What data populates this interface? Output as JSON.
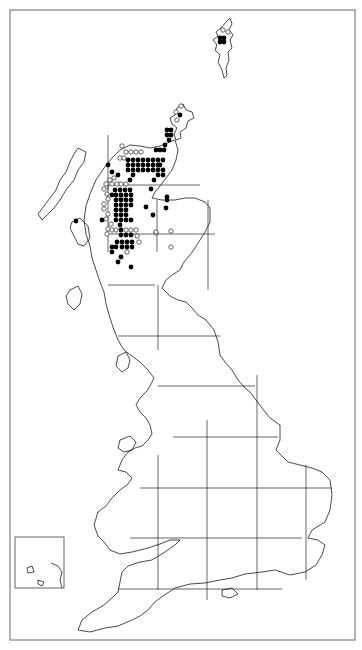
{
  "map": {
    "title": "",
    "region": "Great Britain distribution map",
    "colors": {
      "frame": "#8a8a8a",
      "coast": "#1a1a1a",
      "grid": "#222222",
      "present": "#000000",
      "absent_or_old": "#ffffff"
    },
    "frame": {
      "x": 10,
      "y": 10,
      "w": 345,
      "h": 630
    },
    "inset": {
      "x": 15,
      "y": 537,
      "w": 49,
      "h": 51
    },
    "grid": {
      "vertical": [
        {
          "x": 108,
          "y1": 185,
          "y2": 252
        },
        {
          "x": 108,
          "y1": 135,
          "y2": 190
        },
        {
          "x": 158,
          "y1": 455,
          "y2": 590
        },
        {
          "x": 158,
          "y1": 285,
          "y2": 350
        },
        {
          "x": 157,
          "y1": 200,
          "y2": 252
        },
        {
          "x": 207,
          "y1": 420,
          "y2": 600
        },
        {
          "x": 208,
          "y1": 200,
          "y2": 290
        },
        {
          "x": 257,
          "y1": 375,
          "y2": 590
        },
        {
          "x": 306,
          "y1": 465,
          "y2": 580
        }
      ],
      "horizontal": [
        {
          "y": 185,
          "x1": 108,
          "x2": 200
        },
        {
          "y": 234,
          "x1": 108,
          "x2": 215
        },
        {
          "y": 285,
          "x1": 108,
          "x2": 155
        },
        {
          "y": 336,
          "x1": 118,
          "x2": 220
        },
        {
          "y": 386,
          "x1": 158,
          "x2": 255
        },
        {
          "y": 437,
          "x1": 173,
          "x2": 278
        },
        {
          "y": 488,
          "x1": 140,
          "x2": 332
        },
        {
          "y": 538,
          "x1": 130,
          "x2": 302
        },
        {
          "y": 589,
          "x1": 118,
          "x2": 282
        }
      ]
    },
    "legend": {
      "filled": "recorded (recent)",
      "open": "recorded (earlier)"
    },
    "dots": {
      "filled": [
        [
          220,
          38
        ],
        [
          224,
          38
        ],
        [
          220,
          42
        ],
        [
          224,
          42
        ],
        [
          180,
          115
        ],
        [
          167,
          130
        ],
        [
          171,
          130
        ],
        [
          167,
          135
        ],
        [
          171,
          135
        ],
        [
          169,
          140
        ],
        [
          165,
          145
        ],
        [
          156,
          150
        ],
        [
          160,
          150
        ],
        [
          164,
          150
        ],
        [
          128,
          160
        ],
        [
          133,
          160
        ],
        [
          138,
          160
        ],
        [
          143,
          160
        ],
        [
          148,
          160
        ],
        [
          153,
          160
        ],
        [
          158,
          160
        ],
        [
          163,
          160
        ],
        [
          128,
          165
        ],
        [
          133,
          165
        ],
        [
          138,
          165
        ],
        [
          143,
          165
        ],
        [
          148,
          165
        ],
        [
          153,
          165
        ],
        [
          158,
          165
        ],
        [
          160,
          165
        ],
        [
          128,
          170
        ],
        [
          133,
          170
        ],
        [
          138,
          170
        ],
        [
          143,
          170
        ],
        [
          148,
          170
        ],
        [
          153,
          170
        ],
        [
          158,
          170
        ],
        [
          163,
          170
        ],
        [
          158,
          175
        ],
        [
          163,
          175
        ],
        [
          133,
          175
        ],
        [
          108,
          165
        ],
        [
          112,
          172
        ],
        [
          118,
          175
        ],
        [
          130,
          180
        ],
        [
          154,
          180
        ],
        [
          151,
          189
        ],
        [
          115,
          190
        ],
        [
          120,
          190
        ],
        [
          125,
          190
        ],
        [
          130,
          190
        ],
        [
          112,
          195
        ],
        [
          116,
          195
        ],
        [
          121,
          195
        ],
        [
          126,
          195
        ],
        [
          131,
          195
        ],
        [
          116,
          200
        ],
        [
          121,
          200
        ],
        [
          126,
          200
        ],
        [
          131,
          200
        ],
        [
          116,
          205
        ],
        [
          121,
          205
        ],
        [
          126,
          205
        ],
        [
          131,
          205
        ],
        [
          116,
          210
        ],
        [
          121,
          210
        ],
        [
          126,
          210
        ],
        [
          116,
          215
        ],
        [
          121,
          215
        ],
        [
          126,
          215
        ],
        [
          116,
          220
        ],
        [
          121,
          220
        ],
        [
          126,
          220
        ],
        [
          131,
          220
        ],
        [
          120,
          225
        ],
        [
          121,
          230
        ],
        [
          102,
          220
        ],
        [
          146,
          207
        ],
        [
          167,
          200
        ],
        [
          153,
          215
        ],
        [
          167,
          197
        ],
        [
          121,
          235
        ],
        [
          126,
          235
        ],
        [
          131,
          235
        ],
        [
          117,
          242
        ],
        [
          122,
          242
        ],
        [
          127,
          242
        ],
        [
          132,
          242
        ],
        [
          112,
          247
        ],
        [
          116,
          247
        ],
        [
          122,
          247
        ],
        [
          127,
          247
        ],
        [
          132,
          247
        ],
        [
          112,
          252
        ],
        [
          121,
          257
        ],
        [
          118,
          262
        ],
        [
          131,
          267
        ],
        [
          76,
          221
        ],
        [
          166,
          208
        ]
      ],
      "open": [
        [
          223,
          30
        ],
        [
          228,
          32
        ],
        [
          176,
          112
        ],
        [
          181,
          106
        ],
        [
          177,
          120
        ],
        [
          122,
          146
        ],
        [
          126,
          152
        ],
        [
          131,
          152
        ],
        [
          136,
          152
        ],
        [
          141,
          152
        ],
        [
          120,
          158
        ],
        [
          124,
          158
        ],
        [
          114,
          178
        ],
        [
          110,
          180
        ],
        [
          106,
          184
        ],
        [
          104,
          189
        ],
        [
          107,
          194
        ],
        [
          108,
          199
        ],
        [
          104,
          204
        ],
        [
          104,
          209
        ],
        [
          108,
          214
        ],
        [
          112,
          184
        ],
        [
          117,
          184
        ],
        [
          121,
          184
        ],
        [
          126,
          184
        ],
        [
          121,
          198
        ],
        [
          106,
          219
        ],
        [
          111,
          224
        ],
        [
          108,
          229
        ],
        [
          107,
          234
        ],
        [
          112,
          230
        ],
        [
          116,
          230
        ],
        [
          126,
          230
        ],
        [
          131,
          230
        ],
        [
          136,
          230
        ],
        [
          127,
          252
        ],
        [
          137,
          236
        ],
        [
          139,
          242
        ],
        [
          156,
          233
        ],
        [
          171,
          231
        ],
        [
          171,
          247
        ],
        [
          156,
          232
        ]
      ]
    },
    "outlines": {
      "shetland": "M221 28 L226 22 L230 18 L232 24 L229 30 L233 35 L230 40 L232 48 L228 52 L229 60 L226 68 L227 75 L224 78 L222 70 L218 62 L220 55 L215 50 L217 45 L213 40 L218 36 L216 32 Z",
      "orkney": "M177 108 L183 104 L186 110 L192 112 L194 118 L188 121 L186 128 L180 132 L181 138 L176 140 L174 134 L177 128 L172 124 L170 118 L175 115 Z",
      "scotland_north": "M150 148 L160 146 L175 140 L178 150 L176 160 L172 170 L166 178 L160 186 L155 192 L152 198 L162 200 L175 200 L185 198 L195 198 L205 202 L210 208 L210 222 L205 232 L200 240 L195 248 L190 255 L184 262 L180 270 L172 275 L166 280 L162 288 L170 296 L178 300 L186 302 L192 308 L198 315 L206 320 L214 330 L218 342 L220 355 L225 362 L232 370 L238 380 L245 388 L250 392 L256 400 L262 408 L270 418 L280 425 L280 440 L276 450 L288 462 L300 465 L312 468 L322 472 L330 480 L332 495 L330 510 L325 522 L312 530 L308 538 L318 540 L325 545 L322 555 L316 565 L305 572 L290 575 L275 570 L262 572 L245 574 L232 578 L220 580 L205 583 L190 584 L175 588 L163 596 L155 602 L148 610 L140 616 L132 620 L118 626 L105 628 L90 632 L78 630 L82 620 L92 612 L104 605 L112 598 L118 592 L120 582 L122 572 L128 566 L140 562 L152 560 L165 552 L175 545 L180 540 L170 540 L160 544 L148 548 L132 552 L120 554 L110 550 L104 542 L98 536 L94 525 L98 512 L106 506 L112 498 L120 490 L128 484 L132 478 L126 472 L118 470 L122 460 L128 452 L135 448 L142 446 L148 440 L152 434 L150 425 L146 418 L140 412 L136 405 L140 398 L146 392 L150 386 L154 378 L148 370 L140 362 L132 356 L124 350 L118 340 L114 330 L110 318 L106 304 L104 292 L100 282 L96 270 L92 258 L90 246 L86 234 L84 220 L86 206 L90 194 L96 180 L104 168 L112 158 L120 150 L130 145 L140 146 Z",
      "hebrides": "M78 148 L86 152 L84 162 L78 170 L74 180 L66 190 L60 200 L54 208 L48 214 L42 220 L38 214 L44 206 L50 198 L56 190 L60 180 L66 172 L70 162 L74 154 Z",
      "mull_skye": "M72 222 L80 218 L88 226 L90 238 L84 246 L78 244 L74 236 L70 228 Z",
      "islay_arran": "M70 290 L78 286 L82 294 L80 304 L74 310 L68 304 L66 296 Z",
      "isle_of_man": "M118 356 L126 352 L130 360 L128 368 L122 372 L116 366 Z",
      "anglesey": "M120 440 L130 436 L136 442 L132 450 L124 452 L118 448 Z",
      "isle_of_wight": "M222 590 L232 588 L238 594 L230 598 L222 596 Z",
      "inset_coast": "M51 563 L58 566 L62 572 L60 580 L62 588 M38 580 L44 582 L42 586 L38 584 Z M27 568 L32 566 L34 572 L28 573 Z"
    }
  }
}
